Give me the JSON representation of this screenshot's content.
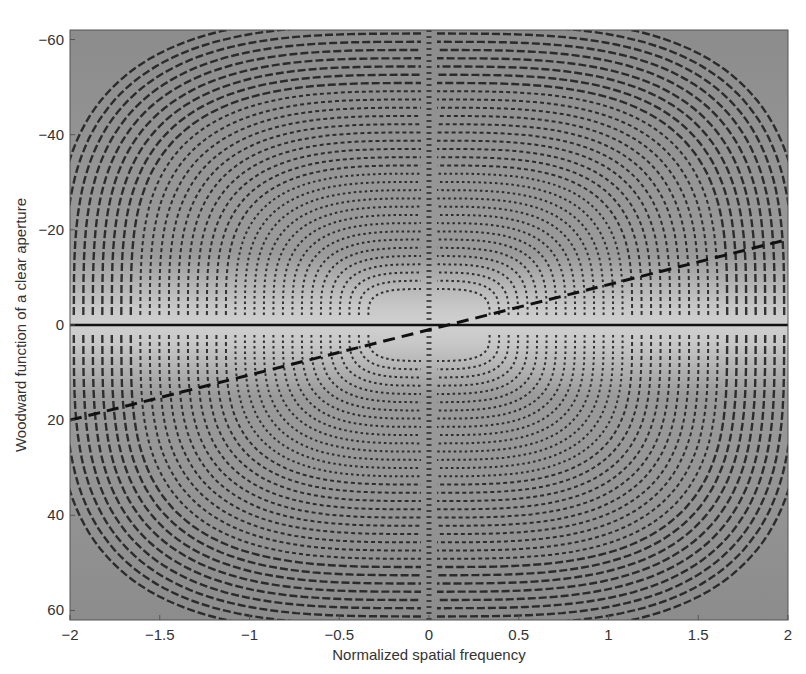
{
  "chart_data": {
    "type": "heatmap",
    "title": "",
    "xlabel": "Normalized spatial frequency",
    "ylabel": "Woodward function of a clear aperture",
    "xlim": [
      -2,
      2
    ],
    "ylim": [
      -62,
      62
    ],
    "y_axis_inverted": true,
    "x_ticks": [
      -2,
      -1.5,
      -1,
      -0.5,
      0,
      0.5,
      1,
      1.5,
      2
    ],
    "x_tick_labels": [
      "−2",
      "−1.5",
      "−1",
      "−0.5",
      "0",
      "0.5",
      "1",
      "1.5",
      "2"
    ],
    "y_ticks": [
      -60,
      -40,
      -20,
      0,
      20,
      40,
      60
    ],
    "y_tick_labels": [
      "−60",
      "−40",
      "−20",
      "0",
      "20",
      "40",
      "60"
    ],
    "grid": false,
    "colormap": "grayscale",
    "background_colors": {
      "outer": "#8c8c8c",
      "center_band": "#c4c4c4",
      "fringe": "#1a1a1a"
    },
    "overlay_lines": [
      {
        "name": "horizontal-axis-line",
        "style": "solid",
        "points": [
          [
            -2,
            0
          ],
          [
            2,
            0
          ]
        ]
      },
      {
        "name": "defocus-line",
        "style": "dashed",
        "points": [
          [
            -2,
            20
          ],
          [
            2,
            -18
          ]
        ]
      }
    ],
    "fringe_families": 4,
    "fringe_symmetry": "quadrant-symmetric hyperbolic contours about x=0 and y=0"
  }
}
